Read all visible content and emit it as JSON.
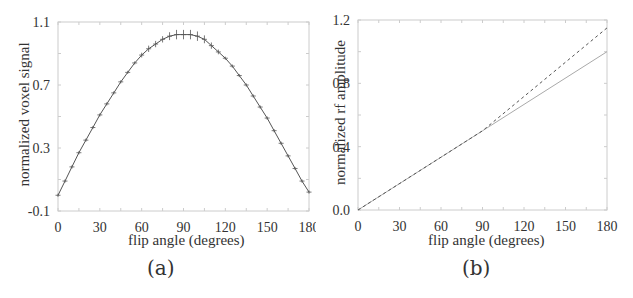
{
  "chart_data": [
    {
      "panel": "a",
      "type": "line",
      "caption": "(a)",
      "title": "",
      "xlabel": "flip angle (degrees)",
      "ylabel": "normalized voxel signal",
      "xlim": [
        0,
        180
      ],
      "ylim": [
        -0.1,
        1.1
      ],
      "xticks": [
        0,
        30,
        60,
        90,
        120,
        150,
        180
      ],
      "yticks": [
        -0.1,
        0.3,
        0.7,
        1.1
      ],
      "xtick_labels": [
        "0",
        "30",
        "60",
        "90",
        "120",
        "150",
        "180"
      ],
      "ytick_labels": [
        "-0.1",
        "0.3",
        "0.7",
        "1.1"
      ],
      "grid": false,
      "error_bars": true,
      "series": [
        {
          "name": "measured signal",
          "style": "solid with error bars",
          "x": [
            0,
            5,
            10,
            15,
            20,
            25,
            30,
            35,
            40,
            45,
            50,
            55,
            60,
            65,
            70,
            75,
            80,
            85,
            90,
            95,
            100,
            105,
            110,
            115,
            120,
            125,
            130,
            135,
            140,
            145,
            150,
            155,
            160,
            165,
            170,
            175,
            180
          ],
          "y": [
            0.0,
            0.09,
            0.18,
            0.27,
            0.35,
            0.43,
            0.51,
            0.58,
            0.65,
            0.72,
            0.78,
            0.84,
            0.89,
            0.93,
            0.96,
            0.99,
            1.01,
            1.02,
            1.02,
            1.02,
            1.01,
            0.99,
            0.95,
            0.91,
            0.87,
            0.82,
            0.76,
            0.7,
            0.63,
            0.56,
            0.49,
            0.41,
            0.33,
            0.25,
            0.17,
            0.09,
            0.02
          ],
          "yerr": [
            0.01,
            0.01,
            0.01,
            0.01,
            0.01,
            0.01,
            0.01,
            0.01,
            0.01,
            0.01,
            0.01,
            0.01,
            0.015,
            0.02,
            0.02,
            0.02,
            0.025,
            0.03,
            0.03,
            0.03,
            0.03,
            0.025,
            0.02,
            0.015,
            0.01,
            0.01,
            0.01,
            0.01,
            0.01,
            0.01,
            0.01,
            0.01,
            0.01,
            0.01,
            0.01,
            0.01,
            0.01
          ]
        }
      ]
    },
    {
      "panel": "b",
      "type": "line",
      "caption": "(b)",
      "title": "",
      "xlabel": "flip angle (degrees)",
      "ylabel": "normalized rf amplitude",
      "xlim": [
        0,
        180
      ],
      "ylim": [
        0.0,
        1.2
      ],
      "xticks": [
        0,
        30,
        60,
        90,
        120,
        150,
        180
      ],
      "yticks": [
        0.0,
        0.4,
        0.8,
        1.2
      ],
      "xtick_labels": [
        "0",
        "30",
        "60",
        "90",
        "120",
        "150",
        "180"
      ],
      "ytick_labels": [
        "0.0",
        "0.4",
        "0.8",
        "1.2"
      ],
      "grid": false,
      "series": [
        {
          "name": "linear (nominal)",
          "style": "solid",
          "x": [
            0,
            90,
            180
          ],
          "y": [
            0.0,
            0.5,
            1.0
          ]
        },
        {
          "name": "corrected",
          "style": "dashed",
          "x": [
            0,
            90,
            180
          ],
          "y": [
            0.0,
            0.5,
            1.15
          ]
        }
      ]
    }
  ],
  "panels": {
    "a": {
      "caption": "(a)",
      "xlabel": "flip angle (degrees)",
      "ylabel": "normalized voxel signal"
    },
    "b": {
      "caption": "(b)",
      "xlabel": "flip angle (degrees)",
      "ylabel": "normalized rf amplitude"
    }
  },
  "colors": {
    "axis": "#cccccc",
    "line": "#555555",
    "line_light": "#aaaaaa",
    "text": "#333333"
  }
}
